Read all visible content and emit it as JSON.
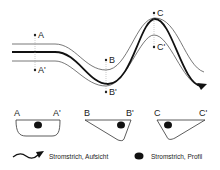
{
  "diagram": {
    "points": {
      "A": "A",
      "A_prime": "A'",
      "B": "B",
      "B_prime": "B'",
      "C": "C",
      "C_prime": "C'"
    },
    "cross_sections": [
      {
        "left": "A",
        "right": "A'",
        "shape": "symmetric-bowl",
        "thalweg_position": "center"
      },
      {
        "left": "B",
        "right": "B'",
        "shape": "asymmetric-deep-right",
        "thalweg_position": "right"
      },
      {
        "left": "C",
        "right": "C'",
        "shape": "asymmetric-deep-left",
        "thalweg_position": "left"
      }
    ],
    "legend": [
      {
        "icon": "wavy-arrow-icon",
        "label": "Stromstrich, Aufsicht"
      },
      {
        "icon": "filled-ellipse-icon",
        "label": "Stromstrich, Profil"
      }
    ],
    "colors": {
      "line": "#222222",
      "bank": "#555555",
      "dashed": "#999999"
    }
  }
}
